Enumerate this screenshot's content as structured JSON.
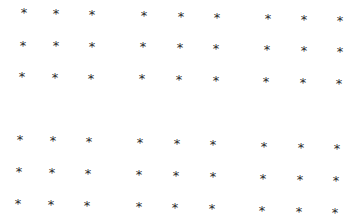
{
  "symbol": "*",
  "color": "#2a2a2a",
  "background": "#ffffff",
  "blocks": [
    {
      "name": "top-left",
      "points": [
        [
          24,
          13
        ],
        [
          56,
          14
        ],
        [
          92,
          15
        ],
        [
          23,
          46
        ],
        [
          56,
          46
        ],
        [
          92,
          47
        ],
        [
          22,
          77
        ],
        [
          55,
          78
        ],
        [
          91,
          79
        ]
      ]
    },
    {
      "name": "top-middle",
      "points": [
        [
          144,
          16
        ],
        [
          181,
          17
        ],
        [
          217,
          18
        ],
        [
          143,
          47
        ],
        [
          180,
          48
        ],
        [
          216,
          49
        ],
        [
          142,
          79
        ],
        [
          179,
          80
        ],
        [
          216,
          81
        ]
      ]
    },
    {
      "name": "top-right",
      "points": [
        [
          268,
          19
        ],
        [
          304,
          20
        ],
        [
          340,
          21
        ],
        [
          267,
          50
        ],
        [
          304,
          51
        ],
        [
          340,
          52
        ],
        [
          266,
          82
        ],
        [
          303,
          83
        ],
        [
          339,
          84
        ]
      ]
    },
    {
      "name": "bottom-left",
      "points": [
        [
          20,
          140
        ],
        [
          53,
          141
        ],
        [
          89,
          142
        ],
        [
          19,
          172
        ],
        [
          52,
          173
        ],
        [
          88,
          174
        ],
        [
          18,
          204
        ],
        [
          51,
          205
        ],
        [
          87,
          206
        ]
      ]
    },
    {
      "name": "bottom-middle",
      "points": [
        [
          140,
          143
        ],
        [
          177,
          144
        ],
        [
          213,
          145
        ],
        [
          139,
          175
        ],
        [
          176,
          176
        ],
        [
          213,
          177
        ],
        [
          139,
          207
        ],
        [
          175,
          208
        ],
        [
          212,
          209
        ]
      ]
    },
    {
      "name": "bottom-right",
      "points": [
        [
          264,
          147
        ],
        [
          301,
          148
        ],
        [
          337,
          149
        ],
        [
          263,
          179
        ],
        [
          300,
          180
        ],
        [
          336,
          181
        ],
        [
          262,
          211
        ],
        [
          299,
          212
        ],
        [
          335,
          213
        ]
      ]
    }
  ]
}
